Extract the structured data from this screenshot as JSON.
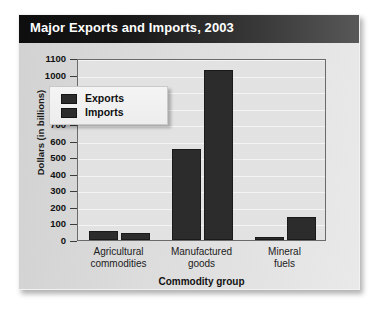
{
  "card": {
    "title": "Major Exports and Imports, 2003"
  },
  "legend": {
    "items": [
      {
        "label": "Exports"
      },
      {
        "label": "Imports"
      }
    ]
  },
  "chart_data": {
    "type": "bar",
    "title": "Major Exports and Imports, 2003",
    "xlabel": "Commodity group",
    "ylabel": "Dollars (in billions)",
    "ylim": [
      0,
      1100
    ],
    "ytick_step": 100,
    "yticks": [
      "1100",
      "1000",
      "900",
      "800",
      "700",
      "600",
      "500",
      "400",
      "300",
      "200",
      "100",
      "0"
    ],
    "grid": true,
    "legend_position": "upper-left-inside",
    "categories": [
      "Agricultural commodities",
      "Manufactured goods",
      "Mineral fuels"
    ],
    "category_lines": [
      [
        "Agricultural",
        "commodities"
      ],
      [
        "Manufactured",
        "goods"
      ],
      [
        "Mineral",
        "fuels"
      ]
    ],
    "series": [
      {
        "name": "Exports",
        "values": [
          55,
          550,
          15
        ]
      },
      {
        "name": "Imports",
        "values": [
          45,
          1025,
          140
        ]
      }
    ],
    "colors": {
      "bar": "#2c2c2c",
      "plot_background": "#e2e2e2",
      "gridline": "#f4f4f4",
      "card_background": "#dcdcdc",
      "titlebar_dark": "#0e0e0e",
      "titlebar_light": "#585858",
      "title_text": "#ffffff"
    }
  }
}
